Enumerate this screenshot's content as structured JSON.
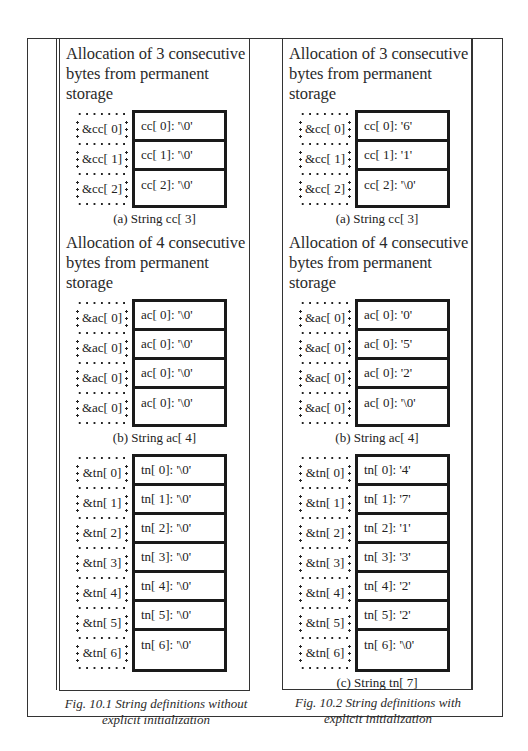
{
  "figures": [
    {
      "caption_line1": "Fig. 10.1 String definitions without",
      "caption_line2": "explicit initialization",
      "sections": [
        {
          "heading_line1": "Allocation of 3 consecutive",
          "heading_line2": "bytes from permanent storage",
          "rows": [
            {
              "addr": "&cc[ 0]",
              "cell": "cc[ 0]: '\\0'"
            },
            {
              "addr": "&cc[ 1]",
              "cell": "cc[ 1]: '\\0'"
            },
            {
              "addr": "&cc[ 2]",
              "cell": "cc[ 2]: '\\0'"
            }
          ],
          "subcaption": "(a) String  cc[ 3]"
        },
        {
          "heading_line1": "Allocation of 4 consecutive",
          "heading_line2": "bytes from permanent storage",
          "rows": [
            {
              "addr": "&ac[ 0]",
              "cell": "ac[ 0]: '\\0'"
            },
            {
              "addr": "&ac[ 0]",
              "cell": "ac[ 0]: '\\0'"
            },
            {
              "addr": "&ac[ 0]",
              "cell": "ac[ 0]: '\\0'"
            },
            {
              "addr": "&ac[ 0]",
              "cell": "ac[ 0]: '\\0'"
            }
          ],
          "subcaption": "(b) String  ac[ 4]"
        },
        {
          "heading_line1": "",
          "heading_line2": "",
          "rows": [
            {
              "addr": "&tn[ 0]",
              "cell": "tn[ 0]: '\\0'"
            },
            {
              "addr": "&tn[ 1]",
              "cell": "tn[ 1]: '\\0'"
            },
            {
              "addr": "&tn[ 2]",
              "cell": "tn[ 2]: '\\0'"
            },
            {
              "addr": "&tn[ 3]",
              "cell": "tn[ 3]: '\\0'"
            },
            {
              "addr": "&tn[ 4]",
              "cell": "tn[ 4]: '\\0'"
            },
            {
              "addr": "&tn[ 5]",
              "cell": "tn[ 5]: '\\0'"
            },
            {
              "addr": "&tn[ 6]",
              "cell": "tn[ 6]: '\\0'"
            }
          ],
          "subcaption": ""
        }
      ]
    },
    {
      "caption_line1": "Fig. 10.2 String definitions with",
      "caption_line2": "explicit initialization",
      "sections": [
        {
          "heading_line1": "Allocation of 3 consecutive",
          "heading_line2": "bytes from permanent storage",
          "rows": [
            {
              "addr": "&cc[ 0]",
              "cell": "cc[ 0]: '6'"
            },
            {
              "addr": "&cc[ 1]",
              "cell": "cc[ 1]: '1'"
            },
            {
              "addr": "&cc[ 2]",
              "cell": "cc[ 2]: '\\0'"
            }
          ],
          "subcaption": "(a) String  cc[ 3]"
        },
        {
          "heading_line1": "Allocation of 4 consecutive",
          "heading_line2": "bytes from permanent storage",
          "rows": [
            {
              "addr": "&ac[ 0]",
              "cell": "ac[ 0]: '0'"
            },
            {
              "addr": "&ac[ 0]",
              "cell": "ac[ 0]: '5'"
            },
            {
              "addr": "&ac[ 0]",
              "cell": "ac[ 0]: '2'"
            },
            {
              "addr": "&ac[ 0]",
              "cell": "ac[ 0]: '\\0'"
            }
          ],
          "subcaption": "(b) String  ac[ 4]"
        },
        {
          "heading_line1": "",
          "heading_line2": "",
          "rows": [
            {
              "addr": "&tn[ 0]",
              "cell": "tn[ 0]: '4'"
            },
            {
              "addr": "&tn[ 1]",
              "cell": "tn[ 1]: '7'"
            },
            {
              "addr": "&tn[ 2]",
              "cell": "tn[ 2]: '1'"
            },
            {
              "addr": "&tn[ 3]",
              "cell": "tn[ 3]: '3'"
            },
            {
              "addr": "&tn[ 4]",
              "cell": "tn[ 4]: '2'"
            },
            {
              "addr": "&tn[ 5]",
              "cell": "tn[ 5]: '2'"
            },
            {
              "addr": "&tn[ 6]",
              "cell": "tn[ 6]: '\\0'"
            }
          ],
          "subcaption": "(c) String  tn[ 7]"
        }
      ]
    }
  ]
}
